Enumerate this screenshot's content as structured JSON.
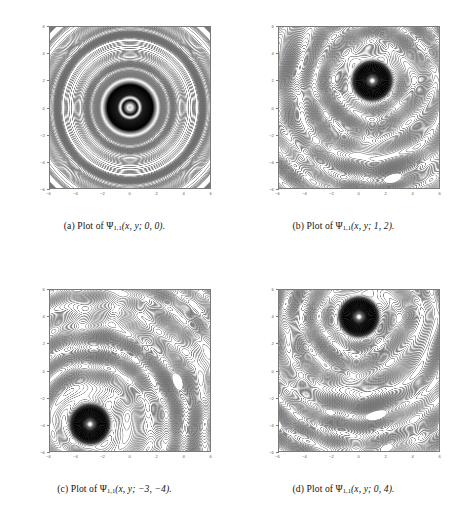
{
  "figure": {
    "type": "contour-plot-grid",
    "rows": 2,
    "columns": 2,
    "background_color": "#ffffff",
    "contour_line_color": "#6b6b6b",
    "axis_color": "#7a7a7a",
    "blob_color": "#000000"
  },
  "panels": [
    {
      "key": "a",
      "caption_prefix": "(a) Plot of",
      "caption_symbol": "Ψ",
      "caption_subscript": "1,1",
      "caption_args": "(x, y; 0, 0).",
      "caption_full": "(a) Plot of Ψ1,1(x, y; 0, 0).",
      "params": {
        "a": 0,
        "b": 0
      },
      "blob_center": {
        "x": 0,
        "y": 0
      },
      "blob_radius": 2.0,
      "pattern": "concentric-bullseye"
    },
    {
      "key": "b",
      "caption_prefix": "(b) Plot of",
      "caption_symbol": "Ψ",
      "caption_subscript": "1,1",
      "caption_args": "(x, y; 1, 2).",
      "caption_full": "(b) Plot of Ψ1,1(x, y; 1, 2).",
      "params": {
        "a": 1,
        "b": 2
      },
      "blob_center": {
        "x": 1,
        "y": 2
      },
      "blob_radius": 1.5,
      "pattern": "offset-interference"
    },
    {
      "key": "c",
      "caption_prefix": "(c) Plot of",
      "caption_symbol": "Ψ",
      "caption_subscript": "1,1",
      "caption_args": "(x, y; −3, −4).",
      "caption_full": "(c) Plot of Ψ1,1(x, y; −3, −4).",
      "params": {
        "a": -3,
        "b": -4
      },
      "blob_center": {
        "x": -3,
        "y": -4
      },
      "blob_radius": 1.5,
      "pattern": "offset-interference"
    },
    {
      "key": "d",
      "caption_prefix": "(d) Plot of",
      "caption_symbol": "Ψ",
      "caption_subscript": "1,1",
      "caption_args": "(x, y; 0, 4).",
      "caption_full": "(d) Plot of Ψ1,1(x, y; 0, 4).",
      "params": {
        "a": 0,
        "b": 4
      },
      "blob_center": {
        "x": 0,
        "y": 4
      },
      "blob_radius": 1.5,
      "pattern": "offset-interference"
    }
  ],
  "chart_data": [
    {
      "type": "heatmap",
      "title": "(a) Plot of Ψ1,1(x, y; 0, 0).",
      "xlabel": "x",
      "ylabel": "y",
      "xlim": [
        -6,
        6
      ],
      "ylim": [
        -6,
        6
      ],
      "xticks": [
        -6,
        -4,
        -2,
        0,
        2,
        4,
        6
      ],
      "yticks": [
        -6,
        -4,
        -2,
        0,
        2,
        4,
        6
      ],
      "xticklabels": [
        "−6",
        "−4",
        "−2",
        "0",
        "2",
        "4",
        "6"
      ],
      "yticklabels": [
        "−6",
        "−4",
        "−2",
        "0",
        "2",
        "4",
        "6"
      ],
      "grid": false,
      "legend": "none",
      "singularity": {
        "x": 0,
        "y": 0
      },
      "annotations": []
    },
    {
      "type": "heatmap",
      "title": "(b) Plot of Ψ1,1(x, y; 1, 2).",
      "xlabel": "x",
      "ylabel": "y",
      "xlim": [
        -6,
        6
      ],
      "ylim": [
        -6,
        6
      ],
      "xticks": [
        -6,
        -4,
        -2,
        0,
        2,
        4,
        6
      ],
      "yticks": [
        -6,
        -4,
        -2,
        0,
        2,
        4,
        6
      ],
      "xticklabels": [
        "−6",
        "−4",
        "−2",
        "0",
        "2",
        "4",
        "6"
      ],
      "yticklabels": [
        "−6",
        "−4",
        "−2",
        "0",
        "2",
        "4",
        "6"
      ],
      "grid": false,
      "legend": "none",
      "singularity": {
        "x": 1,
        "y": 2
      },
      "annotations": []
    },
    {
      "type": "heatmap",
      "title": "(c) Plot of Ψ1,1(x, y; −3, −4).",
      "xlabel": "x",
      "ylabel": "y",
      "xlim": [
        -6,
        6
      ],
      "ylim": [
        -6,
        6
      ],
      "xticks": [
        -6,
        -4,
        -2,
        0,
        2,
        4,
        6
      ],
      "yticks": [
        -6,
        -4,
        -2,
        0,
        2,
        4,
        6
      ],
      "xticklabels": [
        "−6",
        "−4",
        "−2",
        "0",
        "2",
        "4",
        "6"
      ],
      "yticklabels": [
        "−6",
        "−4",
        "−2",
        "0",
        "2",
        "4",
        "6"
      ],
      "grid": false,
      "legend": "none",
      "singularity": {
        "x": -3,
        "y": -4
      },
      "annotations": []
    },
    {
      "type": "heatmap",
      "title": "(d) Plot of Ψ1,1(x, y; 0, 4).",
      "xlabel": "x",
      "ylabel": "y",
      "xlim": [
        -6,
        6
      ],
      "ylim": [
        -6,
        6
      ],
      "xticks": [
        -6,
        -4,
        -2,
        0,
        2,
        4,
        6
      ],
      "yticks": [
        -6,
        -4,
        -2,
        0,
        2,
        4,
        6
      ],
      "xticklabels": [
        "−6",
        "−4",
        "−2",
        "0",
        "2",
        "4",
        "6"
      ],
      "yticklabels": [
        "−6",
        "−4",
        "−2",
        "0",
        "2",
        "4",
        "6"
      ],
      "grid": false,
      "legend": "none",
      "singularity": {
        "x": 0,
        "y": 4
      },
      "annotations": []
    }
  ]
}
